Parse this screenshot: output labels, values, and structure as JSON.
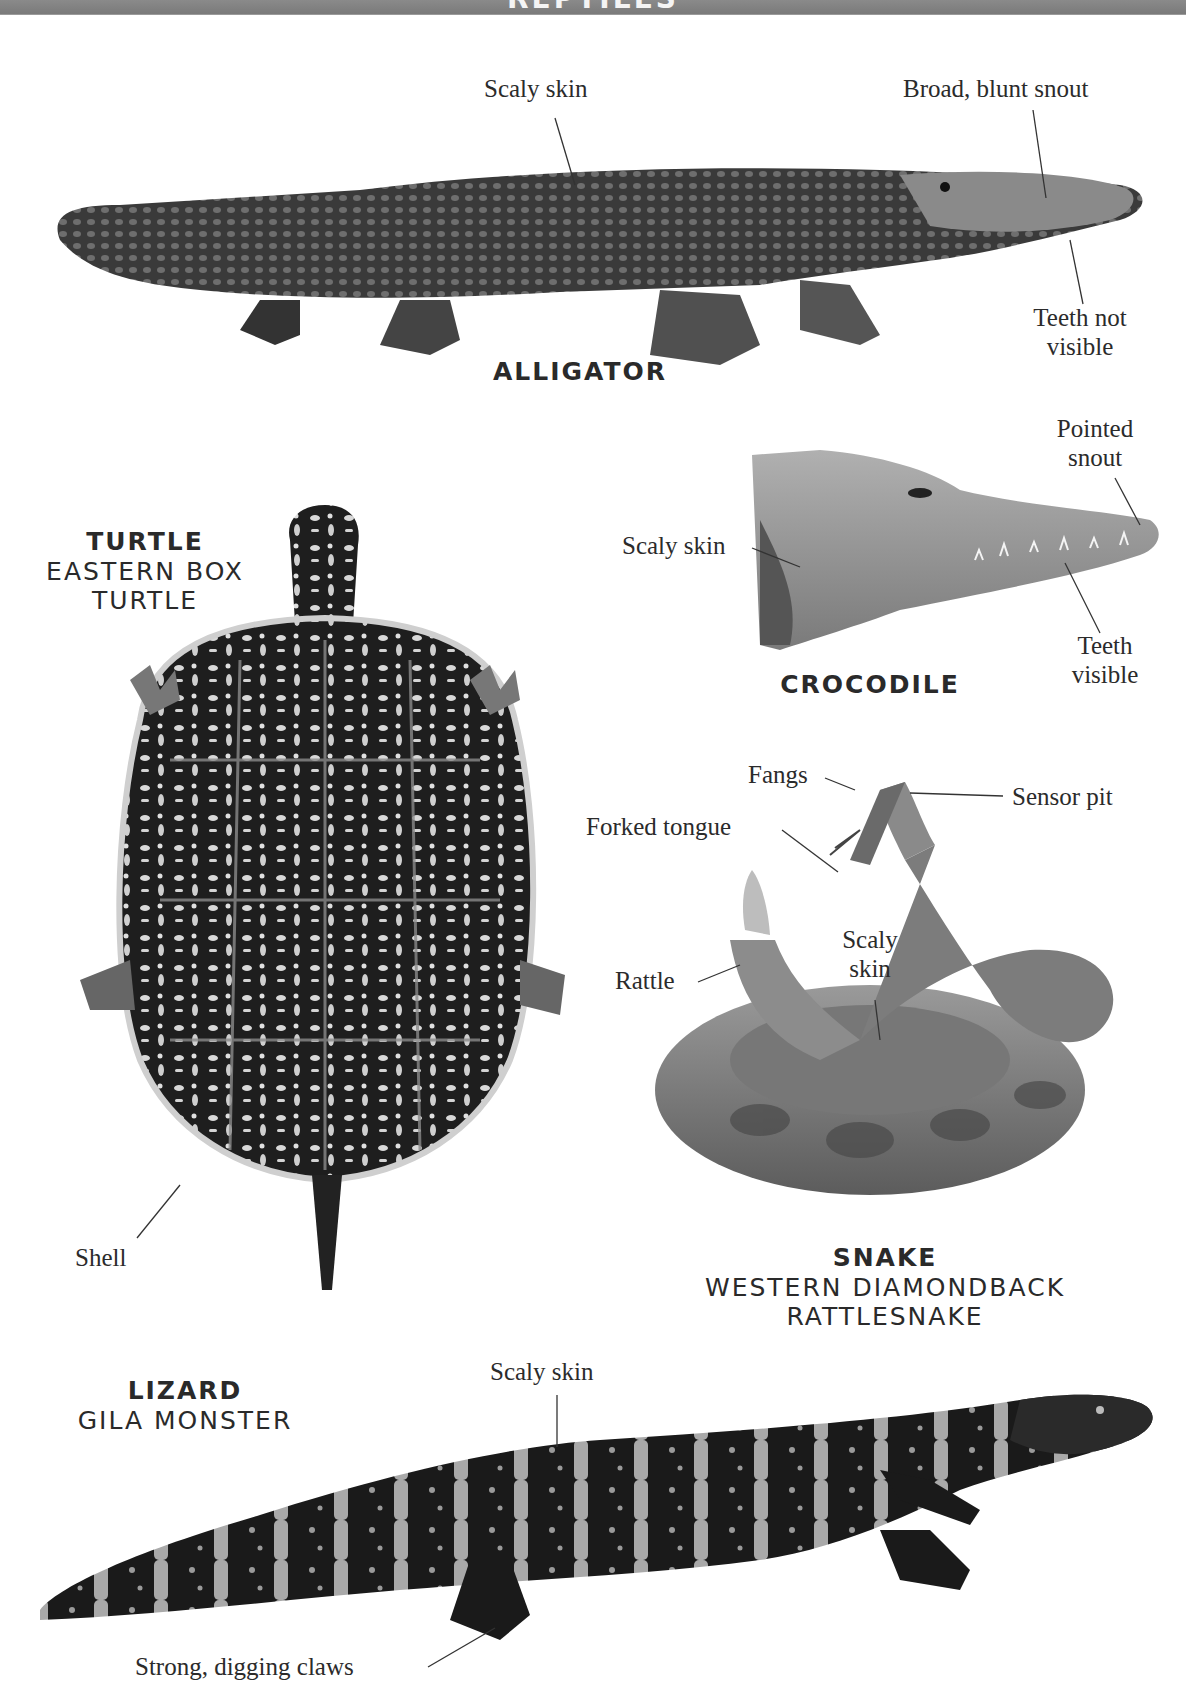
{
  "page": {
    "banner_title": "REPTILES",
    "background": "#ffffff",
    "banner_color": "#808080"
  },
  "alligator": {
    "title": "ALLIGATOR",
    "labels": {
      "scaly_skin": "Scaly skin",
      "snout": "Broad, blunt snout",
      "teeth_line1": "Teeth not",
      "teeth_line2": "visible"
    }
  },
  "crocodile": {
    "title": "CROCODILE",
    "labels": {
      "snout_line1": "Pointed",
      "snout_line2": "snout",
      "scaly_skin": "Scaly skin",
      "teeth_line1": "Teeth",
      "teeth_line2": "visible"
    }
  },
  "turtle": {
    "title": "TURTLE",
    "subtitle_line1": "EASTERN BOX",
    "subtitle_line2": "TURTLE",
    "labels": {
      "shell": "Shell"
    }
  },
  "snake": {
    "title": "SNAKE",
    "subtitle_line1": "WESTERN DIAMONDBACK",
    "subtitle_line2": "RATTLESNAKE",
    "labels": {
      "fangs": "Fangs",
      "sensor_pit": "Sensor pit",
      "forked_tongue": "Forked tongue",
      "scaly_skin_line1": "Scaly",
      "scaly_skin_line2": "skin",
      "rattle": "Rattle"
    }
  },
  "lizard": {
    "title": "LIZARD",
    "subtitle": "GILA MONSTER",
    "labels": {
      "scaly_skin": "Scaly skin",
      "claws": "Strong, digging claws"
    }
  }
}
